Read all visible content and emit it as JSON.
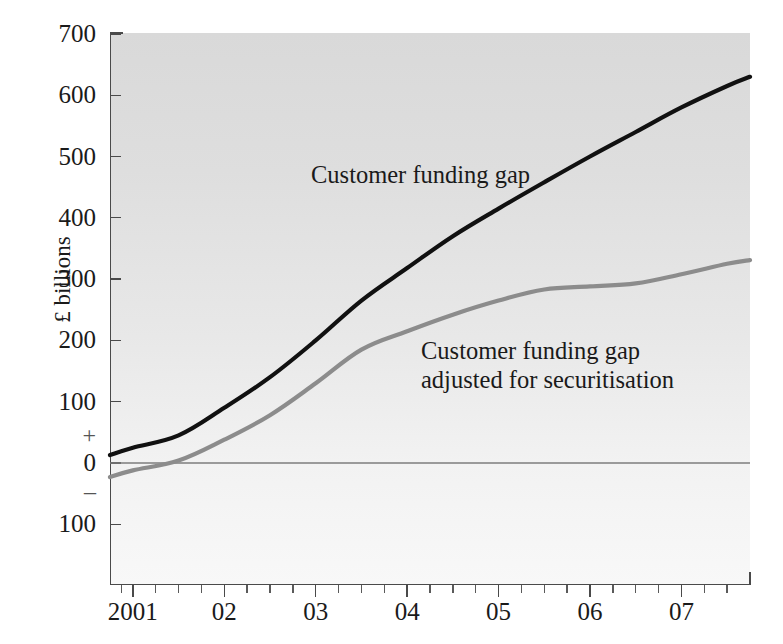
{
  "chart_data": {
    "type": "line",
    "title": "",
    "xlabel": "",
    "ylabel": "£ billions",
    "xlim": [
      2000.75,
      2007.75
    ],
    "ylim": [
      -150,
      700
    ],
    "grid": false,
    "legend_position": "inline-annotations",
    "y_ticks": [
      {
        "value": 700,
        "label": "700"
      },
      {
        "value": 600,
        "label": "600"
      },
      {
        "value": 500,
        "label": "500"
      },
      {
        "value": 400,
        "label": "400"
      },
      {
        "value": 300,
        "label": "300"
      },
      {
        "value": 200,
        "label": "200"
      },
      {
        "value": 100,
        "label": "100"
      },
      {
        "value": 0,
        "label": "0"
      },
      {
        "value": -100,
        "label": "100"
      }
    ],
    "y_sign_markers": [
      {
        "value": 45,
        "label": "+"
      },
      {
        "value": -45,
        "label": "–"
      }
    ],
    "x_ticks": [
      {
        "value": 2001,
        "label": "2001"
      },
      {
        "value": 2002,
        "label": "02"
      },
      {
        "value": 2003,
        "label": "03"
      },
      {
        "value": 2004,
        "label": "04"
      },
      {
        "value": 2005,
        "label": "05"
      },
      {
        "value": 2006,
        "label": "06"
      },
      {
        "value": 2007,
        "label": "07"
      }
    ],
    "x_minor_ticks": [
      2000.875,
      2001.25,
      2001.5,
      2001.75,
      2002.25,
      2002.5,
      2002.75,
      2003.25,
      2003.5,
      2003.75,
      2004.25,
      2004.5,
      2004.75,
      2005.25,
      2005.5,
      2005.75,
      2006.25,
      2006.5,
      2006.75,
      2007.25,
      2007.5
    ],
    "zero_line": 0,
    "series": [
      {
        "name": "Customer funding gap",
        "color": "#111111",
        "width": 4.2,
        "x": [
          2000.75,
          2001.0,
          2001.5,
          2002.0,
          2002.5,
          2003.0,
          2003.5,
          2004.0,
          2004.5,
          2005.0,
          2005.5,
          2006.0,
          2006.5,
          2007.0,
          2007.5,
          2007.75
        ],
        "values": [
          13,
          25,
          45,
          90,
          140,
          200,
          265,
          318,
          370,
          415,
          458,
          500,
          540,
          580,
          615,
          630
        ]
      },
      {
        "name": "Customer funding gap adjusted for securitisation",
        "color": "#8c8c8c",
        "width": 4.2,
        "x": [
          2000.75,
          2001.0,
          2001.5,
          2002.0,
          2002.5,
          2003.0,
          2003.5,
          2004.0,
          2004.5,
          2005.0,
          2005.5,
          2006.0,
          2006.5,
          2007.0,
          2007.5,
          2007.75
        ],
        "values": [
          -23,
          -12,
          4,
          38,
          78,
          130,
          185,
          215,
          242,
          265,
          283,
          288,
          293,
          308,
          325,
          331
        ]
      }
    ],
    "annotations": [
      {
        "text": "Customer funding gap",
        "series": "Customer funding gap"
      },
      {
        "text": "Customer funding gap\nadjusted for securitisation",
        "series": "Customer funding gap adjusted for securitisation"
      }
    ]
  }
}
